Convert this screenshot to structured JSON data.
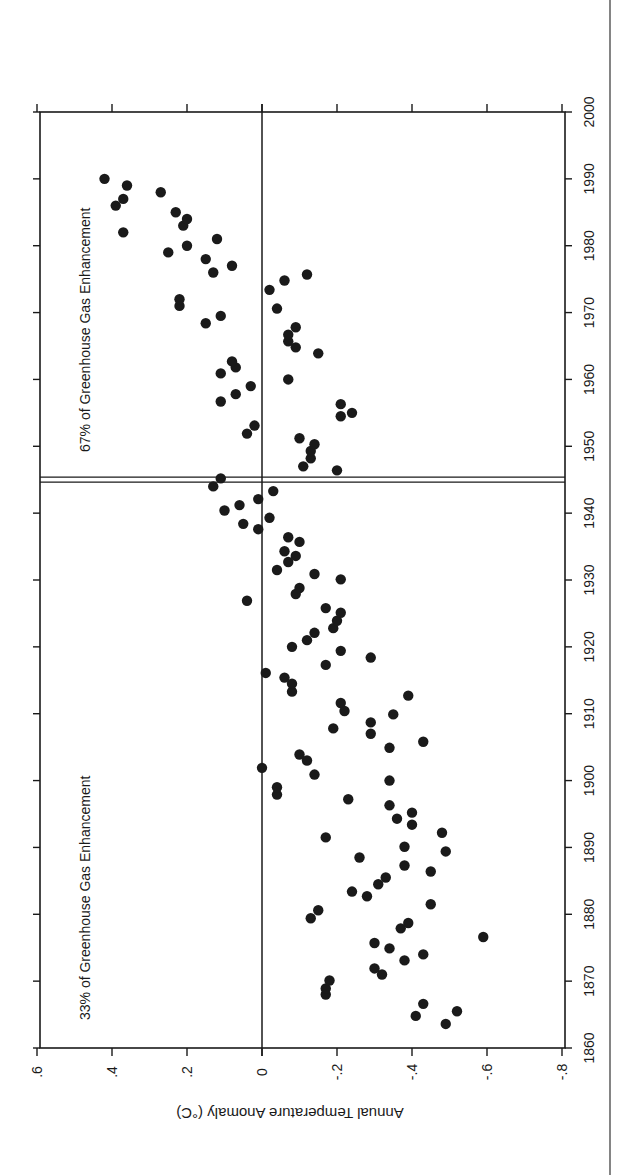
{
  "chart_data": {
    "type": "scatter",
    "orientation_note": "figure rendered rotated 90 degrees clockwise",
    "title": "",
    "xlabel": "",
    "ylabel": "Annual Temperature Anomaly (°C)",
    "xlim": [
      1860,
      2000
    ],
    "ylim": [
      -0.8,
      0.6
    ],
    "x_ticks": [
      1860,
      1870,
      1880,
      1890,
      1900,
      1910,
      1920,
      1930,
      1940,
      1950,
      1960,
      1970,
      1980,
      1990,
      2000
    ],
    "y_ticks": [
      0.6,
      0.4,
      0.2,
      0,
      -0.2,
      -0.4,
      -0.6,
      -0.8
    ],
    "y_tick_labels": [
      ".6",
      ".4",
      ".2",
      "0",
      "-.2",
      "-.4",
      "-.6",
      "-.8"
    ],
    "grid": false,
    "reference_lines": {
      "horizontal_zero": 0,
      "vertical_double_line_year": 1945
    },
    "annotations": [
      {
        "text": "33% of Greenhouse Gas Enhancement",
        "region": "1860-1945"
      },
      {
        "text": "67% of Greenhouse Gas Enhancement",
        "region": "1945-2000"
      }
    ],
    "series": [
      {
        "name": "Annual temperature anomaly",
        "points": [
          [
            1863.6,
            -0.49
          ],
          [
            1864.8,
            -0.41
          ],
          [
            1865.5,
            -0.52
          ],
          [
            1866.6,
            -0.43
          ],
          [
            1868.0,
            -0.17
          ],
          [
            1868.9,
            -0.17
          ],
          [
            1870.1,
            -0.18
          ],
          [
            1871.0,
            -0.32
          ],
          [
            1871.9,
            -0.3
          ],
          [
            1873.1,
            -0.38
          ],
          [
            1874.0,
            -0.43
          ],
          [
            1874.9,
            -0.34
          ],
          [
            1875.7,
            -0.3
          ],
          [
            1876.6,
            -0.59
          ],
          [
            1877.9,
            -0.37
          ],
          [
            1878.7,
            -0.39
          ],
          [
            1879.4,
            -0.13
          ],
          [
            1880.6,
            -0.15
          ],
          [
            1881.5,
            -0.45
          ],
          [
            1882.7,
            -0.28
          ],
          [
            1883.4,
            -0.24
          ],
          [
            1884.5,
            -0.31
          ],
          [
            1885.5,
            -0.33
          ],
          [
            1886.4,
            -0.45
          ],
          [
            1887.3,
            -0.38
          ],
          [
            1888.5,
            -0.26
          ],
          [
            1889.4,
            -0.49
          ],
          [
            1890.1,
            -0.38
          ],
          [
            1891.5,
            -0.17
          ],
          [
            1892.2,
            -0.48
          ],
          [
            1893.4,
            -0.4
          ],
          [
            1894.3,
            -0.36
          ],
          [
            1895.2,
            -0.4
          ],
          [
            1896.3,
            -0.34
          ],
          [
            1897.2,
            -0.23
          ],
          [
            1897.9,
            -0.04
          ],
          [
            1899.0,
            -0.04
          ],
          [
            1900.0,
            -0.34
          ],
          [
            1900.9,
            -0.14
          ],
          [
            1901.9,
            0.0
          ],
          [
            1903.0,
            -0.12
          ],
          [
            1903.9,
            -0.1
          ],
          [
            1904.9,
            -0.34
          ],
          [
            1905.8,
            -0.43
          ],
          [
            1907.0,
            -0.29
          ],
          [
            1907.8,
            -0.19
          ],
          [
            1908.7,
            -0.29
          ],
          [
            1909.9,
            -0.35
          ],
          [
            1910.4,
            -0.22
          ],
          [
            1911.6,
            -0.21
          ],
          [
            1912.7,
            -0.39
          ],
          [
            1913.3,
            -0.08
          ],
          [
            1914.5,
            -0.08
          ],
          [
            1915.4,
            -0.06
          ],
          [
            1916.1,
            -0.01
          ],
          [
            1917.3,
            -0.17
          ],
          [
            1918.4,
            -0.29
          ],
          [
            1919.4,
            -0.21
          ],
          [
            1920.0,
            -0.08
          ],
          [
            1921.0,
            -0.12
          ],
          [
            1922.1,
            -0.14
          ],
          [
            1922.8,
            -0.19
          ],
          [
            1923.9,
            -0.2
          ],
          [
            1925.1,
            -0.21
          ],
          [
            1925.8,
            -0.17
          ],
          [
            1926.9,
            0.04
          ],
          [
            1927.9,
            -0.09
          ],
          [
            1928.8,
            -0.1
          ],
          [
            1930.1,
            -0.21
          ],
          [
            1930.9,
            -0.14
          ],
          [
            1931.5,
            -0.04
          ],
          [
            1932.7,
            -0.07
          ],
          [
            1933.6,
            -0.09
          ],
          [
            1934.3,
            -0.06
          ],
          [
            1935.7,
            -0.1
          ],
          [
            1936.4,
            -0.07
          ],
          [
            1937.6,
            0.01
          ],
          [
            1938.4,
            0.05
          ],
          [
            1939.3,
            -0.02
          ],
          [
            1940.4,
            0.1
          ],
          [
            1941.2,
            0.06
          ],
          [
            1942.1,
            0.01
          ],
          [
            1943.3,
            -0.03
          ],
          [
            1944.0,
            0.13
          ],
          [
            1945.2,
            0.11
          ],
          [
            1946.4,
            -0.2
          ],
          [
            1947.0,
            -0.11
          ],
          [
            1948.2,
            -0.13
          ],
          [
            1949.3,
            -0.13
          ],
          [
            1950.3,
            -0.14
          ],
          [
            1951.2,
            -0.1
          ],
          [
            1951.9,
            0.04
          ],
          [
            1953.1,
            0.02
          ],
          [
            1954.5,
            -0.21
          ],
          [
            1955.0,
            -0.24
          ],
          [
            1956.3,
            -0.21
          ],
          [
            1956.7,
            0.11
          ],
          [
            1957.8,
            0.07
          ],
          [
            1959.0,
            0.03
          ],
          [
            1960.0,
            -0.07
          ],
          [
            1960.9,
            0.11
          ],
          [
            1961.8,
            0.07
          ],
          [
            1962.7,
            0.08
          ],
          [
            1963.9,
            -0.15
          ],
          [
            1964.8,
            -0.09
          ],
          [
            1965.7,
            -0.07
          ],
          [
            1966.7,
            -0.07
          ],
          [
            1967.8,
            -0.09
          ],
          [
            1968.4,
            0.15
          ],
          [
            1969.5,
            0.11
          ],
          [
            1970.6,
            -0.04
          ],
          [
            1971.0,
            0.22
          ],
          [
            1972.0,
            0.22
          ],
          [
            1973.4,
            -0.02
          ],
          [
            1974.8,
            -0.06
          ],
          [
            1975.7,
            -0.12
          ],
          [
            1976.0,
            0.13
          ],
          [
            1977.0,
            0.08
          ],
          [
            1978.0,
            0.15
          ],
          [
            1979.0,
            0.25
          ],
          [
            1980.0,
            0.2
          ],
          [
            1981.0,
            0.12
          ],
          [
            1982.0,
            0.37
          ],
          [
            1983.0,
            0.21
          ],
          [
            1984.0,
            0.2
          ],
          [
            1985.0,
            0.23
          ],
          [
            1986.0,
            0.39
          ],
          [
            1987.0,
            0.37
          ],
          [
            1988.0,
            0.27
          ],
          [
            1989.0,
            0.36
          ],
          [
            1990.0,
            0.42
          ]
        ]
      }
    ]
  },
  "labels": {
    "y_axis_title": "Annual Temperature Anomaly (°C)",
    "annotation_early": "33% of Greenhouse Gas Enhancement",
    "annotation_late": "67% of Greenhouse Gas Enhancement"
  },
  "colors": {
    "ink": "#1a1a1a",
    "background": "#ffffff"
  }
}
